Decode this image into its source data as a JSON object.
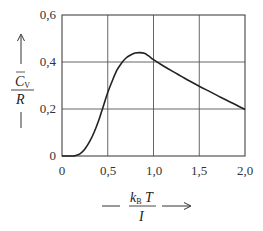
{
  "chart_data": {
    "type": "line",
    "title": "",
    "xlabel": "kB T / I",
    "ylabel": "C̄V / R",
    "xlim": [
      0,
      2.0
    ],
    "ylim": [
      0,
      0.6
    ],
    "grid": true,
    "legend": null,
    "x_ticks": [
      "0",
      "0,5",
      "1,0",
      "1,5",
      "2,0"
    ],
    "y_ticks": [
      "0",
      "0,2",
      "0,4",
      "0,6"
    ],
    "series": [
      {
        "name": "Cv/R",
        "x": [
          0.0,
          0.12,
          0.15,
          0.2,
          0.25,
          0.3,
          0.35,
          0.4,
          0.45,
          0.5,
          0.55,
          0.6,
          0.65,
          0.7,
          0.75,
          0.8,
          0.85,
          0.9,
          0.95,
          1.0,
          1.1,
          1.2,
          1.3,
          1.4,
          1.5,
          1.6,
          1.7,
          1.8,
          1.9,
          2.0
        ],
        "values": [
          0.0,
          0.0,
          0.002,
          0.01,
          0.03,
          0.06,
          0.1,
          0.15,
          0.21,
          0.27,
          0.32,
          0.365,
          0.395,
          0.417,
          0.43,
          0.438,
          0.44,
          0.437,
          0.425,
          0.41,
          0.385,
          0.362,
          0.34,
          0.318,
          0.297,
          0.277,
          0.257,
          0.237,
          0.218,
          0.198
        ]
      }
    ]
  },
  "axes": {
    "x_tick_labels": [
      "0",
      "0,5",
      "1,0",
      "1,5",
      "2,0"
    ],
    "y_tick_labels": [
      "0",
      "0,2",
      "0,4",
      "0,6"
    ],
    "x_label": {
      "numerator_main": "k",
      "numerator_sub": "B",
      "numerator_tail": " T",
      "denominator": "I"
    },
    "y_label": {
      "numerator_main": "C",
      "numerator_sub": "V",
      "denominator": "R"
    }
  }
}
